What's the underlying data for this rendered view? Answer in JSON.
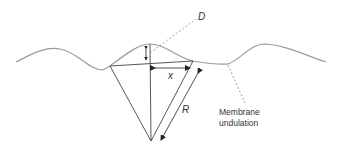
{
  "diagram": {
    "labels": {
      "D": "D",
      "x": "x",
      "R": "R",
      "membrane_line1": "Membrane",
      "membrane_line2": "undulation"
    },
    "colors": {
      "membrane": "#999999",
      "lines": "#444444",
      "dashed": "#888888",
      "text": "#333333"
    }
  }
}
